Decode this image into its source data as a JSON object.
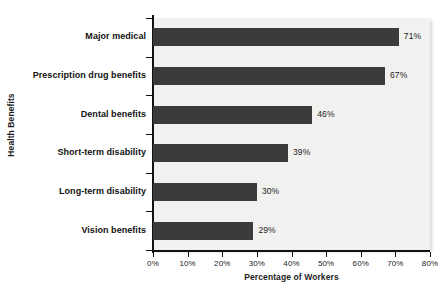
{
  "chart_data": {
    "type": "bar",
    "orientation": "horizontal",
    "title": "",
    "xlabel": "Percentage of Workers",
    "ylabel": "Health Benefits",
    "categories": [
      "Major medical",
      "Prescription drug benefits",
      "Dental benefits",
      "Short-term disability",
      "Long-term disability",
      "Vision benefits"
    ],
    "values": [
      71,
      67,
      46,
      39,
      30,
      29
    ],
    "value_labels": [
      "71%",
      "67%",
      "46%",
      "39%",
      "30%",
      "29%"
    ],
    "xlim": [
      0,
      80
    ],
    "xticks": [
      0,
      10,
      20,
      30,
      40,
      50,
      60,
      70,
      80
    ],
    "xtick_labels": [
      "0%",
      "10%",
      "20%",
      "30%",
      "40%",
      "50%",
      "60%",
      "70%",
      "80%"
    ],
    "grid": false,
    "legend": false,
    "bar_color": "#3b3b3b",
    "plot_background": "#f1f1f0",
    "axis_color": "#111111"
  }
}
